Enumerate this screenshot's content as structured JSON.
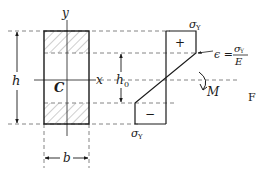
{
  "figure": {
    "section": {
      "axis_y_label": "y",
      "axis_x_label": "x",
      "centroid_label": "C",
      "height_label": "h",
      "width_label": "b",
      "core_height_label": "h",
      "core_height_subscript": "0"
    },
    "stress_diagram": {
      "top_stress_label": "σ",
      "top_stress_subscript": "Y",
      "bottom_stress_label": "σ",
      "bottom_stress_subscript": "Y",
      "tension_sign": "+",
      "compression_sign": "−",
      "strain_label": "ϵ =",
      "strain_numerator": "σ",
      "strain_numerator_subscript": "Y",
      "strain_denominator": "E",
      "moment_label": "M"
    },
    "caption_fragment": "F"
  },
  "colors": {
    "line": "#1a1a1a",
    "dashed": "#555555",
    "hatch": "#777777",
    "background": "#ffffff"
  }
}
